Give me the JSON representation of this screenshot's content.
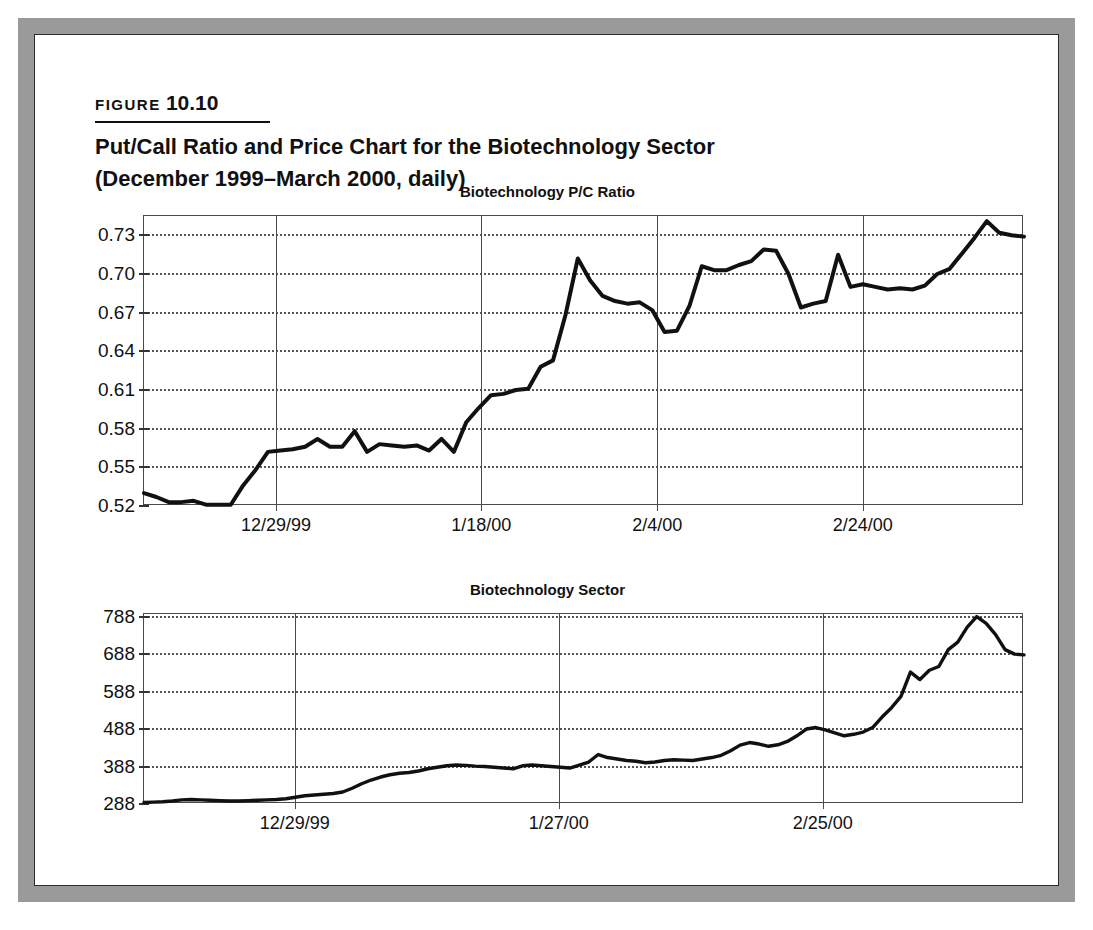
{
  "figure": {
    "label_word": "FIGURE",
    "label_number": "10.10",
    "title_line1": "Put/Call Ratio and Price Chart for the Biotechnology Sector",
    "title_line2": "(December 1999–March 2000, daily)",
    "source_note": "Source: Schaeffer's Daily Sentiment at SchaeffersResearch.com"
  },
  "chart_data": [
    {
      "type": "line",
      "title": "Biotechnology P/C Ratio",
      "xlabel": "",
      "ylabel": "",
      "ylim": [
        0.52,
        0.745
      ],
      "ytick_labels": [
        "0.73",
        "0.70",
        "0.67",
        "0.64",
        "0.61",
        "0.58",
        "0.55",
        "0.52"
      ],
      "ytick_values": [
        0.73,
        0.7,
        0.67,
        0.64,
        0.61,
        0.58,
        0.55,
        0.52
      ],
      "xtick_labels": [
        "12/29/99",
        "1/18/00",
        "2/4/00",
        "2/24/00"
      ],
      "xtick_positions": [
        9,
        23,
        35,
        49
      ],
      "grid": "dotted-horizontal-solid-vertical",
      "legend": "none",
      "x": [
        0,
        1,
        2,
        3,
        4,
        5,
        6,
        7,
        8,
        9,
        10,
        11,
        12,
        13,
        14,
        15,
        16,
        17,
        18,
        19,
        20,
        21,
        22,
        23,
        24,
        25,
        26,
        27,
        28,
        29,
        30,
        31,
        32,
        33,
        34,
        35,
        36,
        37,
        38,
        39,
        40,
        41,
        42,
        43,
        44,
        45,
        46,
        47,
        48,
        49,
        50,
        51,
        52,
        53,
        54,
        55,
        56,
        57,
        58,
        59,
        60
      ],
      "values": [
        0.53,
        0.527,
        0.523,
        0.523,
        0.524,
        0.521,
        0.521,
        0.521,
        0.536,
        0.548,
        0.562,
        0.563,
        0.564,
        0.566,
        0.572,
        0.566,
        0.566,
        0.578,
        0.562,
        0.568,
        0.567,
        0.566,
        0.567,
        0.563,
        0.572,
        0.562,
        0.585,
        0.596,
        0.606,
        0.607,
        0.61,
        0.611,
        0.628,
        0.633,
        0.668,
        0.712,
        0.695,
        0.683,
        0.679,
        0.677,
        0.678,
        0.672,
        0.655,
        0.656,
        0.675,
        0.706,
        0.703,
        0.703,
        0.707,
        0.71,
        0.719,
        0.718,
        0.7,
        0.674,
        0.677,
        0.679,
        0.715,
        0.69,
        0.692,
        0.69,
        0.688
      ],
      "values_tail": [
        0.689,
        0.688,
        0.691,
        0.7,
        0.704,
        0.716,
        0.728,
        0.741,
        0.732,
        0.73,
        0.729
      ]
    },
    {
      "type": "line",
      "title": "Biotechnology Sector",
      "xlabel": "",
      "ylabel": "",
      "ylim": [
        288,
        795
      ],
      "ytick_labels": [
        "788",
        "688",
        "588",
        "488",
        "388",
        "288"
      ],
      "ytick_values": [
        788,
        688,
        588,
        488,
        388,
        288
      ],
      "xtick_labels": [
        "12/29/99",
        "1/27/00",
        "2/25/00"
      ],
      "xtick_positions": [
        12,
        33,
        54
      ],
      "grid": "dotted-horizontal-solid-vertical",
      "legend": "none",
      "x": [
        0,
        1,
        2,
        3,
        4,
        5,
        6,
        7,
        8,
        9,
        10,
        11,
        12,
        13,
        14,
        15,
        16,
        17,
        18,
        19,
        20,
        21,
        22,
        23,
        24,
        25,
        26,
        27,
        28,
        29,
        30,
        31,
        32,
        33,
        34,
        35,
        36,
        37,
        38,
        39,
        40,
        41,
        42,
        43,
        44,
        45,
        46,
        47,
        48,
        49,
        50,
        51,
        52,
        53,
        54,
        55,
        56,
        57,
        58,
        59,
        60,
        61,
        62,
        63,
        64,
        65,
        66,
        67,
        68,
        69,
        70
      ],
      "values": [
        292,
        293,
        294,
        296,
        299,
        300,
        299,
        298,
        297,
        296,
        296,
        297,
        298,
        299,
        300,
        302,
        306,
        310,
        312,
        314,
        316,
        320,
        330,
        342,
        352,
        360,
        366,
        370,
        372,
        376,
        382,
        386,
        390,
        392,
        391,
        389,
        388,
        386,
        384,
        382,
        390,
        392,
        390,
        388,
        386,
        384,
        392,
        400,
        420,
        412,
        408,
        404,
        402,
        398,
        400,
        404,
        406,
        405,
        404,
        408,
        412,
        418,
        430,
        445,
        452,
        448,
        442,
        446,
        455,
        470,
        488,
        492,
        486,
        478,
        470,
        474,
        480,
        492,
        520,
        545,
        575,
        640,
        620,
        645,
        655,
        700,
        720,
        760,
        788,
        770,
        740,
        700,
        688,
        686
      ],
      "peak_value": 788,
      "final_value": 686
    }
  ]
}
